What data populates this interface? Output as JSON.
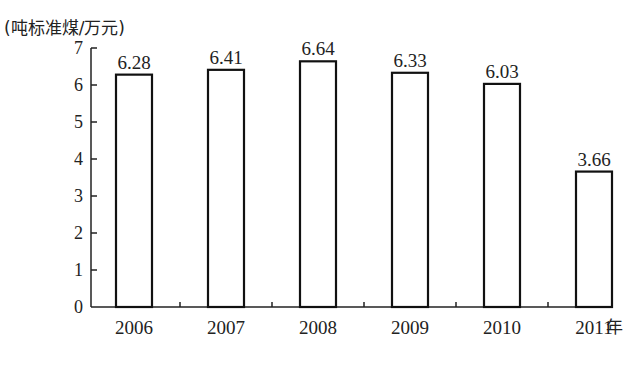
{
  "chart_data": {
    "type": "bar",
    "title": "",
    "ylabel": "(吨标准煤/万元)",
    "xlabel": "年",
    "categories": [
      "2006",
      "2007",
      "2008",
      "2009",
      "2010",
      "2011"
    ],
    "values": [
      6.28,
      6.41,
      6.64,
      6.33,
      6.03,
      3.66
    ],
    "value_labels": [
      "6.28",
      "6.41",
      "6.64",
      "6.33",
      "6.03",
      "3.66"
    ],
    "ylim": [
      0,
      7
    ],
    "yticks": [
      0,
      1,
      2,
      3,
      4,
      5,
      6,
      7
    ],
    "grid": false,
    "legend": "none"
  }
}
